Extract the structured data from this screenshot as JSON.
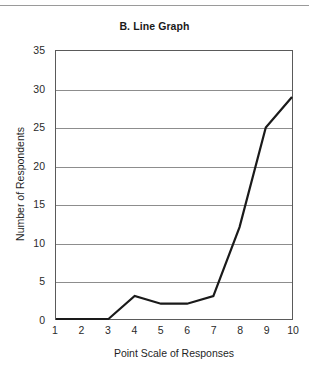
{
  "chart_data": {
    "type": "line",
    "title": "B. Line Graph",
    "xlabel": "Point Scale of Responses",
    "ylabel": "Number of Respondents",
    "x": [
      1,
      2,
      3,
      4,
      5,
      6,
      7,
      8,
      9,
      10
    ],
    "categories": [
      "1",
      "2",
      "3",
      "4",
      "5",
      "6",
      "7",
      "8",
      "9",
      "10"
    ],
    "values": [
      0,
      0,
      0,
      3,
      2,
      2,
      3,
      12,
      25,
      29
    ],
    "series": [
      {
        "name": "Responses",
        "values": [
          0,
          0,
          0,
          3,
          2,
          2,
          3,
          12,
          25,
          29
        ]
      }
    ],
    "xlim": [
      1,
      10
    ],
    "ylim": [
      0,
      35
    ],
    "ytick_values": [
      0,
      5,
      10,
      15,
      20,
      25,
      30,
      35
    ],
    "ytick_labels": [
      "0",
      "5",
      "10",
      "15",
      "20",
      "25",
      "30",
      "35"
    ],
    "grid": "horizontal",
    "legend": "none",
    "line_color": "#1a1a1a",
    "grid_color": "#8d8d8d",
    "border_color": "#5a5a5a",
    "markers": "none"
  }
}
